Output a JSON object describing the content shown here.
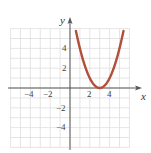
{
  "chart_data": {
    "type": "line",
    "title": "",
    "xlabel": "x",
    "ylabel": "y",
    "xlim": [
      -6,
      6
    ],
    "ylim": [
      -6,
      6
    ],
    "grid": true,
    "x_ticks": [
      -4,
      -2,
      2,
      4
    ],
    "y_ticks": [
      4,
      2,
      -2,
      -4
    ],
    "x_tick_labels": [
      "−4",
      "−2",
      "2",
      "4"
    ],
    "y_tick_labels": [
      "4",
      "2",
      "−2",
      "−4"
    ],
    "series": [
      {
        "name": "y = (x - 3)^2",
        "color": "#b0503a",
        "x": [
          0.6,
          1,
          1.5,
          2,
          2.5,
          3,
          3.5,
          4,
          4.5,
          5,
          5.4
        ],
        "y": [
          5.76,
          4,
          2.25,
          1,
          0.25,
          0,
          0.25,
          1,
          2.25,
          4,
          5.76
        ]
      }
    ]
  },
  "colors": {
    "grid": "#dedede",
    "axis": "#555555",
    "curve": "#b0503a"
  }
}
